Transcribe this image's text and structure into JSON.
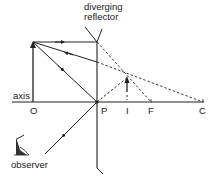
{
  "diagram": {
    "title": "diverging reflector",
    "title_lines": [
      "diverging",
      "reflector"
    ],
    "labels": {
      "axis": "axis",
      "O": "O",
      "P": "P",
      "I": "I",
      "F": "F",
      "C": "C",
      "observer": "observer"
    },
    "colors": {
      "line": "#222222",
      "background": "#ffffff"
    },
    "elements": {
      "mirror": "convex mirror (diverging reflector)",
      "object": "upright object arrow at O",
      "image": "virtual upright diminished image at I",
      "observer_icon": "eye-icon"
    }
  }
}
